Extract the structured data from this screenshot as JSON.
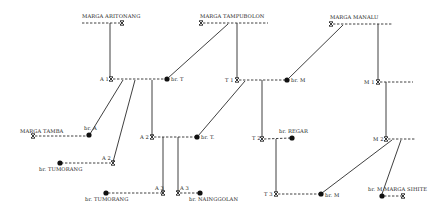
{
  "diagram": {
    "type": "kinship-genealogy",
    "clans": [
      {
        "id": "aritonang",
        "label": "MARGA ARITONANG"
      },
      {
        "id": "tampubolon",
        "label": "MARGA TAMPUBOLON"
      },
      {
        "id": "manalu",
        "label": "MARGA MANALU"
      },
      {
        "id": "tamba",
        "label": "MARGA TAMBA"
      },
      {
        "id": "sihite",
        "label": "MARGA SIHITE"
      }
    ],
    "nodes": {
      "a1": "A 1",
      "a2_left": "A 2",
      "a2": "A 2",
      "a3_left": "A 3",
      "a3_right": "A 3",
      "t1": "T 1",
      "t2": "T 2",
      "t3": "T 3",
      "m1": "M 1",
      "m2": "M 2",
      "br_t_1": "br. T",
      "br_a": "br. A",
      "br_tumorang_1": "br. TUMORANG",
      "br_tumorang_2": "br. TUMORANG",
      "br_t_2": "br. T.",
      "br_nainggolan": "br. NAINGGOLAN",
      "br_m_1": "br. M",
      "br_regar": "br. REGAR",
      "br_m_2": "br. M",
      "br_m_3": "br. M"
    },
    "legend_symbols": {
      "male": "cross-mark",
      "female": "filled-dot",
      "marriage": "dashed-line",
      "descent": "solid-line"
    }
  }
}
